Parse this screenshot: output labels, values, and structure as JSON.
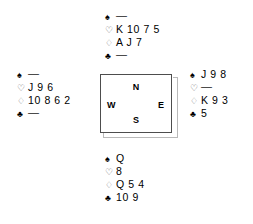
{
  "diagram": {
    "type": "bridge-deal-diagram",
    "void_marker": "—",
    "suit_symbols": {
      "spades": "♠",
      "hearts": "♡",
      "diamonds": "♢",
      "clubs": "♣"
    },
    "compass": {
      "north": "N",
      "east": "E",
      "south": "S",
      "west": "W"
    },
    "hands": {
      "north": {
        "position_label": "N",
        "spades": "—",
        "hearts": "K 10 7 5",
        "diamonds": "A J 7",
        "clubs": "—"
      },
      "west": {
        "position_label": "W",
        "spades": "—",
        "hearts": "J 9 6",
        "diamonds": "10 8 6 2",
        "clubs": "—"
      },
      "east": {
        "position_label": "E",
        "spades": "J 9 8",
        "hearts": "—",
        "diamonds": "K 9 3",
        "clubs": "5"
      },
      "south": {
        "position_label": "S",
        "spades": "Q",
        "hearts": "8",
        "diamonds": "Q 5 4",
        "clubs": "10 9"
      }
    },
    "colors": {
      "ink": "#000000",
      "outline_suit": "#666666",
      "box_border": "#4d4d4d",
      "box_shadow": "#b9b9b9",
      "background": "#ffffff"
    }
  }
}
